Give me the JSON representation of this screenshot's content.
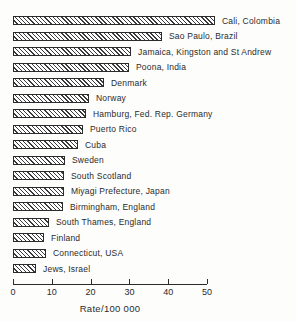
{
  "chart_data": {
    "type": "bar",
    "orientation": "horizontal",
    "title": "",
    "xlabel": "Rate/100 000",
    "ylabel": "",
    "xlim": [
      0,
      50
    ],
    "xticks": [
      0,
      10,
      20,
      30,
      40,
      50
    ],
    "grid": false,
    "legend": false,
    "bar_style": "diagonal-hatch",
    "bar_outline_color": "#2b2b2b",
    "background_color": "#fdfdfc",
    "categories": [
      "Cali, Colombia",
      "Sao Paulo, Brazil",
      "Jamaica, Kingston and St Andrew",
      "Poona, India",
      "Denmark",
      "Norway",
      "Hamburg, Fed. Rep. Germany",
      "Puerto Rico",
      "Cuba",
      "Sweden",
      "South Scotland",
      "Miyagi Prefecture, Japan",
      "Birmingham, England",
      "South Thames, England",
      "Finland",
      "Connecticut, USA",
      "Jews, Israel"
    ],
    "values": [
      51.5,
      38,
      30,
      29.5,
      23,
      19.2,
      18.4,
      17.6,
      16.3,
      12.9,
      12.6,
      12.6,
      12.3,
      8.8,
      7.5,
      7.9,
      5.5
    ]
  },
  "axis": {
    "tick_labels": [
      "0",
      "10",
      "20",
      "30",
      "40",
      "50"
    ],
    "label": "Rate/100 000"
  }
}
